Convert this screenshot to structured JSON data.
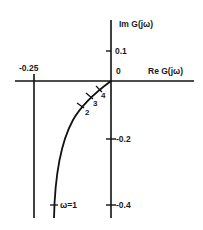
{
  "diagram": {
    "type": "nyquist-plot",
    "axes": {
      "real_label": "Re G(jω)",
      "imag_label": "Im G(jω)",
      "origin_label": "0"
    },
    "ticks": {
      "real": [
        {
          "label": "-0.25",
          "value": -0.25
        }
      ],
      "imag": [
        {
          "label": "0.1",
          "value": 0.1
        },
        {
          "label": "-0.2",
          "value": -0.2
        },
        {
          "label": "-0.4",
          "value": -0.4
        }
      ]
    },
    "asymptote": {
      "re": -0.25,
      "description": "vertical asymptote at Re = -0.25"
    },
    "curve_points": [
      {
        "label": "4",
        "omega": 4
      },
      {
        "label": "3",
        "omega": 3
      },
      {
        "label": "2",
        "omega": 2
      },
      {
        "label": "ω=1",
        "omega": 1
      }
    ],
    "colors": {
      "line": "#111111",
      "background": "#ffffff"
    }
  }
}
